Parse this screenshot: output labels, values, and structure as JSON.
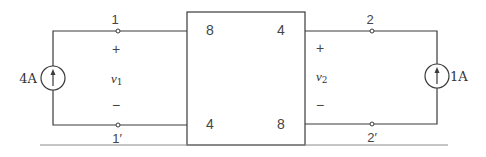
{
  "diagram": {
    "type": "two-port network circuit",
    "network_box": {
      "port1_top_label": "8",
      "port1_bottom_label": "4",
      "port2_top_label": "4",
      "port2_bottom_label": "8"
    },
    "left_port": {
      "source_label": "4A",
      "terminal_top": "1",
      "terminal_bottom": "1′",
      "voltage_var": "v",
      "voltage_sub": "1",
      "plus": "+",
      "minus": "−"
    },
    "right_port": {
      "source_label": "1A",
      "terminal_top": "2",
      "terminal_bottom": "2′",
      "voltage_var": "v",
      "voltage_sub": "2",
      "plus": "+",
      "minus": "−"
    },
    "colors": {
      "line": "#3a3a3a",
      "text": "#333333",
      "rule": "#8a8a8a",
      "background": "#ffffff"
    }
  }
}
